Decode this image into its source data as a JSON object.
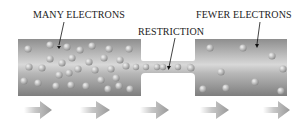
{
  "labels": {
    "many": "MANY ELECTRONS",
    "restriction": "RESTRICTION",
    "fewer": "FEWER ELECTRONS"
  },
  "colors": {
    "tube_dark": "#8a8a8a",
    "tube_light": "#dedede",
    "electron": "#c8c8c8",
    "arrow": "#b0b0b0"
  },
  "flow_arrows": 5
}
